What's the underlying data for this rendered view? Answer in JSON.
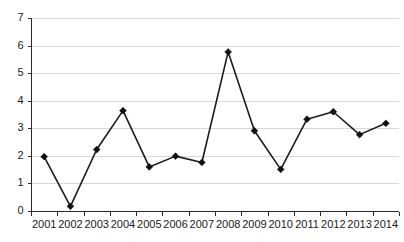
{
  "chart_data": {
    "type": "line",
    "title": "",
    "subtitle": "",
    "xlabel": "",
    "ylabel": "",
    "categories": [
      "2001",
      "2002",
      "2003",
      "2004",
      "2005",
      "2006",
      "2007",
      "2008",
      "2009",
      "2010",
      "2011",
      "2012",
      "2013",
      "2014"
    ],
    "values": [
      1.97,
      0.17,
      2.23,
      3.64,
      1.6,
      1.99,
      1.76,
      5.77,
      2.91,
      1.51,
      3.33,
      3.6,
      2.77,
      3.18
    ],
    "series": [
      {
        "name": "series-1",
        "values": [
          1.97,
          0.17,
          2.23,
          3.64,
          1.6,
          1.99,
          1.76,
          5.77,
          2.91,
          1.51,
          3.33,
          3.6,
          2.77,
          3.18
        ]
      }
    ],
    "ylim": [
      0,
      7
    ],
    "yticks": [
      0,
      1,
      2,
      3,
      4,
      5,
      6,
      7
    ],
    "ytick_labels": [
      "0",
      "1",
      "2",
      "3",
      "4",
      "5",
      "6",
      "7"
    ],
    "xtick_labels": [
      "2001",
      "2002",
      "2003",
      "2004",
      "2005",
      "2006",
      "2007",
      "2008",
      "2009",
      "2010",
      "2011",
      "2012",
      "2013",
      "2014"
    ],
    "grid": true,
    "grid_axis": "y",
    "legend": false,
    "legend_position": "none",
    "marker": "diamond",
    "colors": {
      "line": "#1c1c1c",
      "marker": "#111111",
      "grid": "#d8d8d8",
      "axis": "#2b2b2b",
      "background": "#ffffff",
      "text": "#1a1a1a"
    },
    "annotations": []
  }
}
